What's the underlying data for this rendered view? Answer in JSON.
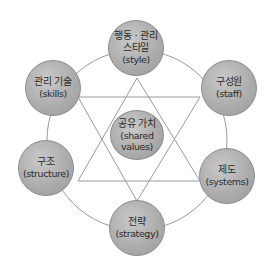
{
  "diagram": {
    "title": "",
    "nodes": [
      {
        "id": "style",
        "ko": "행동 · 관리\n스타일",
        "ko_line1": "행동 · 관리",
        "ko_line2": "스타일",
        "en": "(style)"
      },
      {
        "id": "skills",
        "ko": "관리 기술",
        "en": "(skills)"
      },
      {
        "id": "staff",
        "ko": "구성원",
        "en": "(staff)"
      },
      {
        "id": "shared_values",
        "ko": "공유 가치",
        "en_line1": "(shared",
        "en_line2": "values)"
      },
      {
        "id": "structure",
        "ko": "구조",
        "en": "(structure)"
      },
      {
        "id": "systems",
        "ko": "제도",
        "en": "(systems)"
      },
      {
        "id": "strategy",
        "ko": "전략",
        "en": "(strategy)"
      }
    ],
    "edges": [
      {
        "from": "style",
        "to": "structure",
        "shape": "upward-triangle"
      },
      {
        "from": "style",
        "to": "systems",
        "shape": "upward-triangle"
      },
      {
        "from": "structure",
        "to": "systems",
        "shape": "upward-triangle"
      },
      {
        "from": "skills",
        "to": "staff",
        "shape": "downward-triangle"
      },
      {
        "from": "skills",
        "to": "strategy",
        "shape": "downward-triangle"
      },
      {
        "from": "staff",
        "to": "strategy",
        "shape": "downward-triangle"
      }
    ],
    "outer_ring": "circle connecting the six outer nodes",
    "colors": {
      "node_fill": "#adadad",
      "node_border": "#8a8a8a",
      "line": "#9a9a9a",
      "text": "#2a2a2a",
      "background": "#ffffff"
    }
  }
}
